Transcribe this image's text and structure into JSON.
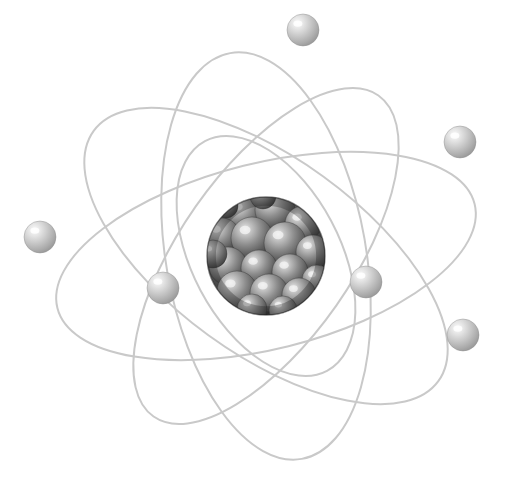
{
  "illustration": {
    "title": "Atom Model",
    "subject": "atom-diagram",
    "width": 508,
    "height": 494,
    "background_color": "#ffffff"
  },
  "colors": {
    "background": "#ffffff",
    "orbit_stroke": "#c9c9c9",
    "orbit_stroke_light": "#d4d4d4",
    "electron_light": "#f2f2f2",
    "electron_mid": "#c2c2c2",
    "electron_dark": "#9a9a9a",
    "electron_edge": "#8c8c8c",
    "nucleus_shell_light": "#9e9e9e",
    "nucleus_shell_dark": "#2e2e2e",
    "nucleon_light": "#e8e8e8",
    "nucleon_mid": "#8a8a8a",
    "nucleon_dark": "#3a3a3a"
  },
  "nucleus": {
    "label": "nucleus",
    "cx": 266,
    "cy": 256,
    "r": 59,
    "nucleon_count": 19,
    "nucleons": [
      {
        "cx": 244,
        "cy": 214,
        "r": 19
      },
      {
        "cx": 275,
        "cy": 210,
        "r": 20
      },
      {
        "cx": 303,
        "cy": 224,
        "r": 18
      },
      {
        "cx": 222,
        "cy": 236,
        "r": 18
      },
      {
        "cx": 252,
        "cy": 238,
        "r": 21
      },
      {
        "cx": 285,
        "cy": 243,
        "r": 21
      },
      {
        "cx": 313,
        "cy": 252,
        "r": 17
      },
      {
        "cx": 228,
        "cy": 266,
        "r": 19
      },
      {
        "cx": 259,
        "cy": 268,
        "r": 18
      },
      {
        "cx": 290,
        "cy": 272,
        "r": 18
      },
      {
        "cx": 317,
        "cy": 280,
        "r": 15
      },
      {
        "cx": 237,
        "cy": 291,
        "r": 20
      },
      {
        "cx": 269,
        "cy": 293,
        "r": 19
      },
      {
        "cx": 299,
        "cy": 295,
        "r": 17
      },
      {
        "cx": 252,
        "cy": 309,
        "r": 15
      },
      {
        "cx": 283,
        "cy": 310,
        "r": 14
      },
      {
        "cx": 213,
        "cy": 254,
        "r": 14
      },
      {
        "cx": 263,
        "cy": 196,
        "r": 13
      },
      {
        "cx": 226,
        "cy": 206,
        "r": 12
      }
    ]
  },
  "orbits": [
    {
      "name": "orbit-1",
      "rx": 215,
      "ry": 93,
      "rotation": -14,
      "stroke_width": 2.0
    },
    {
      "name": "orbit-2",
      "rx": 213,
      "ry": 98,
      "rotation": 36,
      "stroke_width": 2.0
    },
    {
      "name": "orbit-3",
      "rx": 206,
      "ry": 100,
      "rotation": 80,
      "stroke_width": 2.0
    },
    {
      "name": "orbit-4",
      "rx": 196,
      "ry": 86,
      "rotation": 125,
      "stroke_width": 2.0
    },
    {
      "name": "orbit-5",
      "rx": 130,
      "ry": 74,
      "rotation": 62,
      "stroke_width": 2.0
    }
  ],
  "electrons": [
    {
      "name": "electron-top",
      "cx": 303,
      "cy": 30,
      "r": 16
    },
    {
      "name": "electron-right-upper",
      "cx": 460,
      "cy": 142,
      "r": 16
    },
    {
      "name": "electron-left",
      "cx": 40,
      "cy": 237,
      "r": 16
    },
    {
      "name": "electron-inner-left",
      "cx": 163,
      "cy": 288,
      "r": 16
    },
    {
      "name": "electron-inner-right",
      "cx": 366,
      "cy": 282,
      "r": 16
    },
    {
      "name": "electron-right-lower",
      "cx": 463,
      "cy": 335,
      "r": 16
    }
  ]
}
